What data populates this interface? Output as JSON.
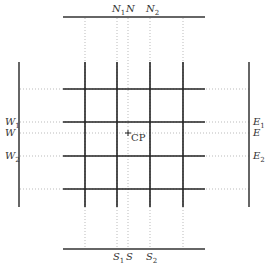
{
  "diagram": {
    "title": "",
    "north_labels": [
      {
        "name": "N",
        "sub": "1",
        "x": 117
      },
      {
        "name": "N",
        "sub": "",
        "x": 128
      },
      {
        "name": "N",
        "sub": "2",
        "x": 150
      }
    ],
    "south_labels": [
      {
        "name": "S",
        "sub": "1",
        "x": 117
      },
      {
        "name": "S",
        "sub": "",
        "x": 128
      },
      {
        "name": "S",
        "sub": "2",
        "x": 150
      }
    ],
    "west_labels": [
      {
        "name": "W",
        "sub": "1",
        "y": 122
      },
      {
        "name": "W",
        "sub": "",
        "y": 133
      },
      {
        "name": "W",
        "sub": "2",
        "y": 156
      }
    ],
    "east_labels": [
      {
        "name": "E",
        "sub": "1",
        "y": 122
      },
      {
        "name": "E",
        "sub": "",
        "y": 133
      },
      {
        "name": "E",
        "sub": "2",
        "y": 156
      }
    ],
    "center_point": {
      "label": "CP",
      "marker": "+",
      "x": 128,
      "y": 133
    },
    "grid_vertical_x": [
      85,
      117,
      150,
      183
    ],
    "grid_horizontal_y": [
      89,
      122,
      156,
      189
    ],
    "colors": {
      "line": "#222222",
      "dotted": "#bbbbbb"
    }
  }
}
